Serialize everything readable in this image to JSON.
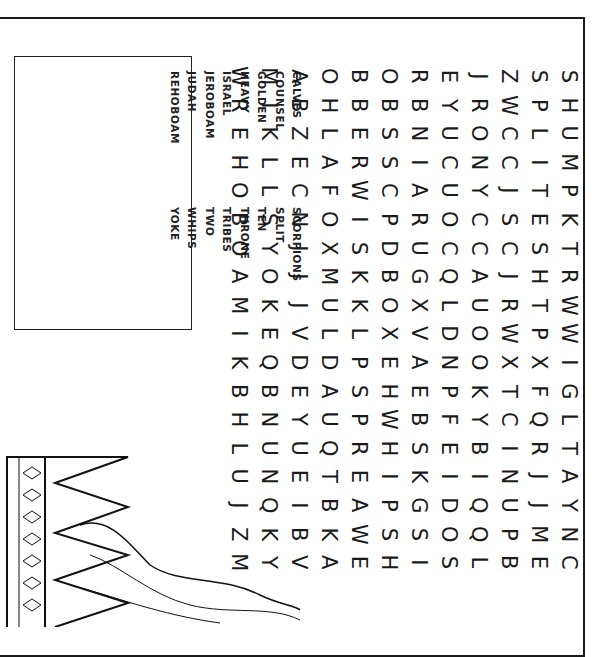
{
  "puzzle": {
    "title": "Word Search",
    "word_list": {
      "column_1": [
        "CALVES",
        "COUNSEL",
        "GOLDEN",
        "HEAVY",
        "ISRAEL",
        "JEROBOAM",
        "JUDAH",
        "REHOBOAM"
      ],
      "column_2": [
        "SCORPIONS",
        "SPLIT",
        "TEN",
        "THRONE",
        "TRIBES",
        "TWO",
        "WHIPS",
        "YOKE"
      ]
    },
    "grid_rows": [
      [
        "W",
        "M",
        "A",
        "O",
        "B",
        "O",
        "R",
        "E",
        "J",
        "Z",
        "S",
        "S"
      ],
      [
        "R",
        "I",
        "B",
        "H",
        "B",
        "B",
        "B",
        "Y",
        "R",
        "W",
        "P",
        "H"
      ],
      [
        "E",
        "K",
        "Z",
        "L",
        "E",
        "S",
        "N",
        "U",
        "O",
        "C",
        "L",
        "U"
      ],
      [
        "H",
        "L",
        "E",
        "A",
        "R",
        "S",
        "I",
        "C",
        "N",
        "C",
        "I",
        "M"
      ],
      [
        "O",
        "L",
        "C",
        "F",
        "W",
        "C",
        "A",
        "U",
        "Y",
        "J",
        "T",
        "P"
      ],
      [
        "B",
        "S",
        "N",
        "O",
        "I",
        "P",
        "R",
        "O",
        "C",
        "S",
        "E",
        "K"
      ],
      [
        "O",
        "Y",
        "J",
        "X",
        "S",
        "D",
        "U",
        "C",
        "C",
        "C",
        "S",
        "T"
      ],
      [
        "A",
        "O",
        "J",
        "M",
        "K",
        "B",
        "G",
        "Q",
        "A",
        "J",
        "H",
        "R"
      ],
      [
        "M",
        "K",
        "J",
        "U",
        "K",
        "O",
        "X",
        "L",
        "U",
        "R",
        "T",
        "W"
      ],
      [
        "I",
        "E",
        "V",
        "L",
        "L",
        "X",
        "V",
        "D",
        "O",
        "W",
        "P",
        "W"
      ],
      [
        "K",
        "Q",
        "D",
        "D",
        "P",
        "E",
        "A",
        "N",
        "O",
        "X",
        "X",
        "I"
      ],
      [
        "B",
        "B",
        "E",
        "A",
        "S",
        "H",
        "E",
        "P",
        "K",
        "T",
        "F",
        "G"
      ],
      [
        "H",
        "N",
        "Y",
        "U",
        "P",
        "W",
        "B",
        "F",
        "Y",
        "C",
        "Q",
        "L"
      ],
      [
        "L",
        "U",
        "U",
        "Q",
        "R",
        "H",
        "S",
        "E",
        "B",
        "I",
        "R",
        "T"
      ],
      [
        "U",
        "N",
        "E",
        "T",
        "E",
        "I",
        "K",
        "I",
        "I",
        "N",
        "J",
        "A"
      ],
      [
        "J",
        "Q",
        "I",
        "B",
        "A",
        "P",
        "G",
        "D",
        "Q",
        "U",
        "J",
        "Y"
      ],
      [
        "Z",
        "K",
        "B",
        "K",
        "W",
        "S",
        "S",
        "O",
        "Q",
        "P",
        "M",
        "N"
      ],
      [
        "M",
        "Y",
        "V",
        "A",
        "E",
        "H",
        "I",
        "S",
        "L",
        "B",
        "E",
        "C"
      ]
    ]
  },
  "colors": {
    "ink": "#1a1a1a",
    "paper": "#ffffff"
  }
}
